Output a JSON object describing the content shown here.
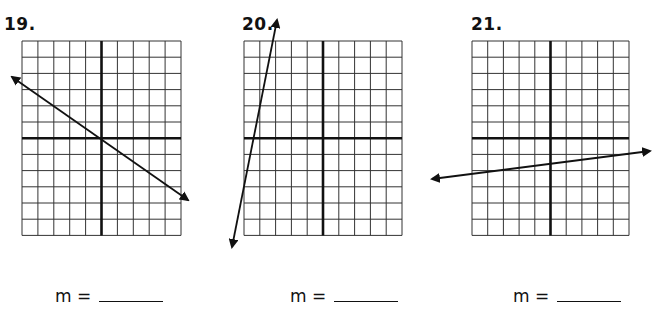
{
  "problems": [
    {
      "number": "19.",
      "label_pos": [
        4,
        14
      ],
      "answer_label": "m =",
      "answer_pos": [
        55,
        286
      ],
      "grid": {
        "x": 22,
        "y": 41,
        "cols": 10,
        "rows": 12,
        "cell_w": 15.9,
        "cell_h": 16.2,
        "axis_col": 5,
        "axis_row": 6
      },
      "line": {
        "x1": 12,
        "y1": 77,
        "x2": 188,
        "y2": 200
      }
    },
    {
      "number": "20.",
      "label_pos": [
        242,
        14
      ],
      "answer_label": "m =",
      "answer_pos": [
        290,
        286
      ],
      "grid": {
        "x": 244,
        "y": 41,
        "cols": 10,
        "rows": 12,
        "cell_w": 15.8,
        "cell_h": 16.2,
        "axis_col": 5,
        "axis_row": 6
      },
      "line": {
        "x1": 232,
        "y1": 247,
        "x2": 277,
        "y2": 20
      }
    },
    {
      "number": "21.",
      "label_pos": [
        471,
        14
      ],
      "answer_label": "m =",
      "answer_pos": [
        513,
        286
      ],
      "grid": {
        "x": 472,
        "y": 41,
        "cols": 10,
        "rows": 12,
        "cell_w": 15.7,
        "cell_h": 16.2,
        "axis_col": 5,
        "axis_row": 6
      },
      "line": {
        "x1": 432,
        "y1": 179,
        "x2": 650,
        "y2": 151
      }
    }
  ],
  "colors": {
    "grid": "#333333",
    "axis": "#111111",
    "line": "#111111"
  }
}
